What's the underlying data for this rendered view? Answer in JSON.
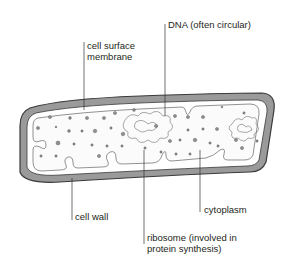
{
  "diagram": {
    "colors": {
      "cell_wall_fill": "#9a9a9a",
      "outline": "#3a3a3a",
      "cytoplasm_fill": "#fafafa",
      "ribosome_fill": "#8f8f8f",
      "leader_line": "#333333"
    },
    "labels": [
      {
        "id": "cell-surface-membrane",
        "lines": [
          "cell surface",
          "membrane"
        ]
      },
      {
        "id": "dna",
        "lines": [
          "DNA (often circular)"
        ]
      },
      {
        "id": "cell-wall",
        "lines": [
          "cell wall"
        ]
      },
      {
        "id": "cytoplasm",
        "lines": [
          "cytoplasm"
        ]
      },
      {
        "id": "ribosome",
        "lines": [
          "ribosome (involved in",
          "protein synthesis)"
        ]
      }
    ]
  }
}
